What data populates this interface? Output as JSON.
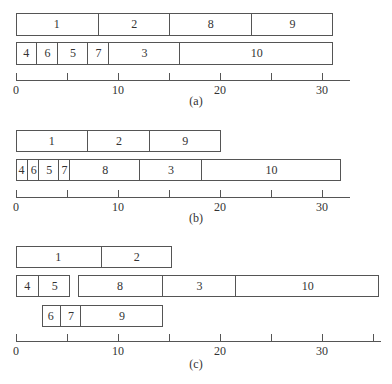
{
  "scale": {
    "origin_px": 16,
    "px_per_unit": 10.2
  },
  "panels": [
    {
      "id": "a",
      "caption": "(a)",
      "rows": [
        {
          "top": 13,
          "height": 23,
          "bins": [
            {
              "start": 0,
              "end": 31,
              "items": [
                {
                  "label": "1",
                  "start": 0,
                  "end": 8
                },
                {
                  "label": "2",
                  "start": 8,
                  "end": 15
                },
                {
                  "label": "8",
                  "start": 15,
                  "end": 23
                },
                {
                  "label": "9",
                  "start": 23,
                  "end": 31
                }
              ]
            }
          ]
        },
        {
          "top": 42,
          "height": 23,
          "bins": [
            {
              "start": 0,
              "end": 31,
              "items": [
                {
                  "label": "4",
                  "start": 0,
                  "end": 2
                },
                {
                  "label": "6",
                  "start": 2,
                  "end": 4
                },
                {
                  "label": "5",
                  "start": 4,
                  "end": 7
                },
                {
                  "label": "7",
                  "start": 7,
                  "end": 9
                },
                {
                  "label": "3",
                  "start": 9,
                  "end": 16
                },
                {
                  "label": "10",
                  "start": 16,
                  "end": 31
                }
              ]
            }
          ]
        }
      ],
      "axis": {
        "y": 80,
        "end_px": 350,
        "ticks": [
          0,
          5,
          10,
          15,
          20,
          25,
          30
        ],
        "labels": [
          "0",
          "10",
          "20",
          "30"
        ]
      },
      "caption_y": 94
    },
    {
      "id": "b",
      "caption": "(b)",
      "rows": [
        {
          "top": 130,
          "height": 22,
          "bins": [
            {
              "start": 0,
              "end": 20,
              "items": [
                {
                  "label": "1",
                  "start": 0,
                  "end": 7
                },
                {
                  "label": "2",
                  "start": 7,
                  "end": 13
                },
                {
                  "label": "9",
                  "start": 13,
                  "end": 20
                }
              ]
            }
          ]
        },
        {
          "top": 159,
          "height": 22,
          "bins": [
            {
              "start": 0,
              "end": 31.8,
              "items": [
                {
                  "label": "4",
                  "start": 0,
                  "end": 1.1
                },
                {
                  "label": "6",
                  "start": 1.1,
                  "end": 2.2
                },
                {
                  "label": "5",
                  "start": 2.2,
                  "end": 4.1
                },
                {
                  "label": "7",
                  "start": 4.1,
                  "end": 5.2
                },
                {
                  "label": "8",
                  "start": 5.2,
                  "end": 12.1
                },
                {
                  "label": "3",
                  "start": 12.1,
                  "end": 18.1
                },
                {
                  "label": "10",
                  "start": 18.1,
                  "end": 31.8
                }
              ]
            }
          ]
        }
      ],
      "axis": {
        "y": 197,
        "end_px": 350,
        "ticks": [
          0,
          5,
          10,
          15,
          20,
          25,
          30
        ],
        "labels": [
          "0",
          "10",
          "20",
          "30"
        ]
      },
      "caption_y": 211
    },
    {
      "id": "c",
      "caption": "(c)",
      "rows": [
        {
          "top": 246,
          "height": 22,
          "bins": [
            {
              "start": 0,
              "end": 15.2,
              "items": [
                {
                  "label": "1",
                  "start": 0,
                  "end": 8.3
                },
                {
                  "label": "2",
                  "start": 8.3,
                  "end": 15.2
                }
              ]
            }
          ]
        },
        {
          "top": 275,
          "height": 22,
          "bins": [
            {
              "start": 0,
              "end": 5.2,
              "items": [
                {
                  "label": "4",
                  "start": 0,
                  "end": 2.2
                },
                {
                  "label": "5",
                  "start": 2.2,
                  "end": 5.2
                }
              ]
            },
            {
              "start": 6.1,
              "end": 35.5,
              "items": [
                {
                  "label": "8",
                  "start": 6.1,
                  "end": 14.3
                },
                {
                  "label": "3",
                  "start": 14.3,
                  "end": 21.5
                },
                {
                  "label": "10",
                  "start": 21.5,
                  "end": 35.5
                }
              ]
            }
          ]
        },
        {
          "top": 305,
          "height": 22,
          "bins": [
            {
              "start": 2.5,
              "end": 14.3,
              "items": [
                {
                  "label": "6",
                  "start": 2.5,
                  "end": 4.3
                },
                {
                  "label": "7",
                  "start": 4.3,
                  "end": 6.3
                },
                {
                  "label": "9",
                  "start": 6.3,
                  "end": 14.3
                }
              ]
            }
          ]
        }
      ],
      "axis": {
        "y": 341,
        "end_px": 381,
        "ticks": [
          0,
          5,
          10,
          15,
          20,
          25,
          30,
          35
        ],
        "labels": [
          "0",
          "10",
          "20",
          "30"
        ]
      },
      "caption_y": 357
    }
  ]
}
